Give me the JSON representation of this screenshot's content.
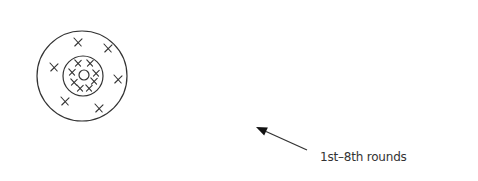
{
  "diagram": {
    "label": "1st–8th rounds",
    "colors": {
      "stroke": "#333333",
      "background": "#ffffff"
    },
    "target": {
      "outer_ring": {
        "cx": 82,
        "cy": 76,
        "r": 45
      },
      "inner_ring": {
        "cx": 83,
        "cy": 76,
        "r": 20
      },
      "bullseye": {
        "cx": 84,
        "cy": 75,
        "r": 5
      },
      "outer_marks": [
        {
          "x": 78,
          "y": 42
        },
        {
          "x": 108,
          "y": 48
        },
        {
          "x": 54,
          "y": 67
        },
        {
          "x": 118,
          "y": 79
        },
        {
          "x": 65,
          "y": 101
        },
        {
          "x": 99,
          "y": 108
        }
      ],
      "inner_marks": [
        {
          "x": 78,
          "y": 63
        },
        {
          "x": 90,
          "y": 63
        },
        {
          "x": 72,
          "y": 72
        },
        {
          "x": 96,
          "y": 73
        },
        {
          "x": 74,
          "y": 82
        },
        {
          "x": 94,
          "y": 81
        },
        {
          "x": 80,
          "y": 88
        },
        {
          "x": 89,
          "y": 88
        }
      ]
    },
    "arrow": {
      "x1": 307,
      "y1": 150,
      "x2": 256,
      "y2": 127
    }
  }
}
